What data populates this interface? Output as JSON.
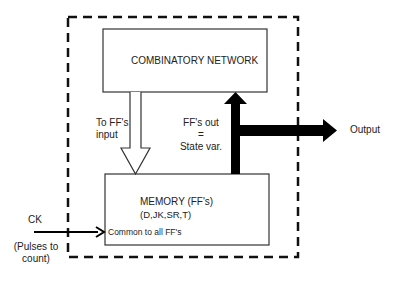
{
  "diagram": {
    "type": "sequential-circuit-block-diagram",
    "boundary": {
      "style": "dashed"
    },
    "blocks": {
      "combinatory": {
        "label": "COMBINATORY NETWORK"
      },
      "memory": {
        "label_line1": "MEMORY (FF's)",
        "label_line2": "(D,JK,SR,T)",
        "clock_note": "Common to all FF's"
      }
    },
    "arrows": {
      "to_ff_input": {
        "label_line1": "To FF's",
        "label_line2": "input",
        "style": "hollow"
      },
      "ff_out": {
        "label_line1": "FF's out",
        "label_line2": "=",
        "label_line3": "State var.",
        "style": "solid-thick"
      },
      "output": {
        "label": "Output",
        "style": "solid-thick"
      },
      "clock": {
        "label": "CK",
        "note_line1": "(Pulses to",
        "note_line2": "count)",
        "style": "thin"
      }
    },
    "colors": {
      "stroke": "#111111",
      "background": "#ffffff"
    }
  }
}
